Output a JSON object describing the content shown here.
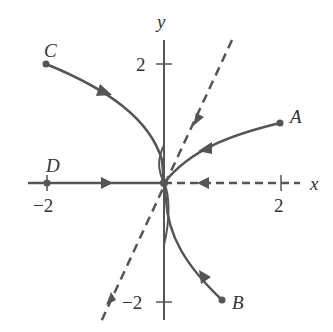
{
  "diagram": {
    "type": "phase_portrait",
    "axes": {
      "x_label": "x",
      "y_label": "y",
      "x_ticks": [
        {
          "value": -2,
          "label": "−2"
        },
        {
          "value": 2,
          "label": "2"
        }
      ],
      "y_ticks": [
        {
          "value": 2,
          "label": "2"
        },
        {
          "value": -2,
          "label": "−2"
        }
      ]
    },
    "points": [
      {
        "name": "A",
        "x": 2,
        "y": 1
      },
      {
        "name": "B",
        "x": 1,
        "y": -2
      },
      {
        "name": "C",
        "x": -2,
        "y": 2
      },
      {
        "name": "D",
        "x": -2,
        "y": 0
      }
    ],
    "trajectories": [
      {
        "from": "A",
        "to": "origin",
        "style": "solid"
      },
      {
        "from": "B",
        "to": "origin",
        "style": "solid"
      },
      {
        "from": "C",
        "to": "origin",
        "style": "solid"
      },
      {
        "from": "D",
        "to": "origin",
        "style": "solid"
      },
      {
        "name": "positive x-axis",
        "to": "origin",
        "style": "dashed"
      },
      {
        "name": "line y = 2x",
        "to": "origin",
        "style": "dashed"
      }
    ],
    "line_color": "#555555"
  }
}
